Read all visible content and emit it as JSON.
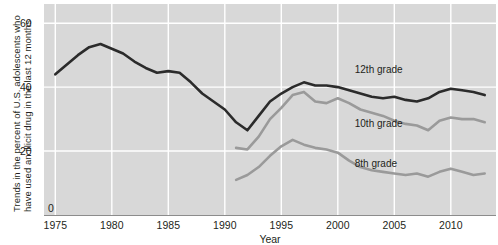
{
  "chart_data": {
    "type": "line",
    "title": "",
    "xlabel": "Year",
    "ylabel": "Trends in the percent of U.S. adolescents who have used an illicit drug in the last 12 months",
    "ylabel_line1": "Trends in the percent of U.S. adolescents who",
    "ylabel_line2": "have used an illicit drug in the last 12 months",
    "xlim": [
      1974,
      2014
    ],
    "ylim": [
      0,
      66
    ],
    "xticks": [
      1975,
      1980,
      1985,
      1990,
      1995,
      2000,
      2005,
      2010
    ],
    "xtick_labels": [
      "1975",
      "1980",
      "1985",
      "1990",
      "1995",
      "2000",
      "2005",
      "2010"
    ],
    "yticks": [
      0,
      20,
      40,
      60
    ],
    "ytick_labels": [
      "0",
      "20",
      "40",
      "60"
    ],
    "grid": true,
    "grid_color": "#ffffff",
    "panel_background": "#d8d8d8",
    "legend_position": "inline-annotations",
    "series": [
      {
        "name": "12th grade",
        "color": "#2b2b2b",
        "label_x": 2001.5,
        "label_y": 45.5,
        "x": [
          1975,
          1976,
          1977,
          1978,
          1979,
          1980,
          1981,
          1982,
          1983,
          1984,
          1985,
          1986,
          1987,
          1988,
          1989,
          1990,
          1991,
          1992,
          1993,
          1994,
          1995,
          1996,
          1997,
          1998,
          1999,
          2000,
          2001,
          2002,
          2003,
          2004,
          2005,
          2006,
          2007,
          2008,
          2009,
          2010,
          2011,
          2012,
          2013
        ],
        "values": [
          44.0,
          47.0,
          50.0,
          52.5,
          53.5,
          52.0,
          50.5,
          48.0,
          46.0,
          44.5,
          45.0,
          44.5,
          41.5,
          38.0,
          35.5,
          33.0,
          29.0,
          26.5,
          31.0,
          35.5,
          38.0,
          40.0,
          41.5,
          40.5,
          40.5,
          40.0,
          39.0,
          38.0,
          37.0,
          36.5,
          37.0,
          36.0,
          35.5,
          36.5,
          38.5,
          39.5,
          39.0,
          38.5,
          37.5
        ]
      },
      {
        "name": "10th grade",
        "color": "#9a9a9a",
        "label_x": 2001.5,
        "label_y": 28.5,
        "x": [
          1991,
          1992,
          1993,
          1994,
          1995,
          1996,
          1997,
          1998,
          1999,
          2000,
          2001,
          2002,
          2003,
          2004,
          2005,
          2006,
          2007,
          2008,
          2009,
          2010,
          2011,
          2012,
          2013
        ],
        "values": [
          21.0,
          20.5,
          24.5,
          30.0,
          33.5,
          37.5,
          38.5,
          35.5,
          35.0,
          36.5,
          35.0,
          33.0,
          32.0,
          31.0,
          29.5,
          28.5,
          28.0,
          26.5,
          29.5,
          30.5,
          30.0,
          30.0,
          29.0
        ]
      },
      {
        "name": "8th grade",
        "color": "#9a9a9a",
        "label_x": 2001.5,
        "label_y": 16.0,
        "x": [
          1991,
          1992,
          1993,
          1994,
          1995,
          1996,
          1997,
          1998,
          1999,
          2000,
          2001,
          2002,
          2003,
          2004,
          2005,
          2006,
          2007,
          2008,
          2009,
          2010,
          2011,
          2012,
          2013
        ],
        "values": [
          11.0,
          12.5,
          15.0,
          18.5,
          21.5,
          23.5,
          22.0,
          21.0,
          20.5,
          19.5,
          17.0,
          15.0,
          14.0,
          13.5,
          13.0,
          12.5,
          13.0,
          12.0,
          13.5,
          14.5,
          13.5,
          12.5,
          13.0
        ]
      }
    ]
  }
}
